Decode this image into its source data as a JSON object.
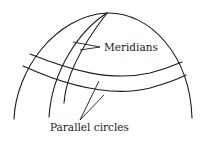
{
  "diagram": {
    "type": "globe-sketch",
    "labels": {
      "meridians": "Meridians",
      "parallel_circles": "Parallel circles"
    },
    "elements": {
      "outer_boundary": "globe outline arc",
      "meridians_count": 2,
      "parallel_circles_count": 2
    },
    "colors": {
      "stroke": "#1a1a1a",
      "background": "#ffffff"
    }
  }
}
